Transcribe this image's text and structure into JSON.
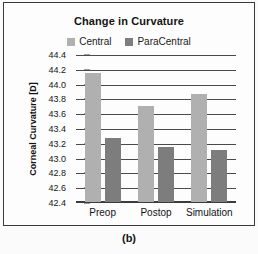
{
  "figure": {
    "caption": "(b)"
  },
  "chart_data": {
    "type": "bar",
    "title": "Change in Curvature",
    "xlabel": "",
    "ylabel": "Corneal Curvature [D]",
    "categories": [
      "Preop",
      "Postop",
      "Simulation"
    ],
    "series": [
      {
        "name": "Central",
        "color": "#b0b0b0",
        "values": [
          44.15,
          43.7,
          43.86
        ]
      },
      {
        "name": "ParaCentral",
        "color": "#7d7d7d",
        "values": [
          43.27,
          43.15,
          43.1
        ]
      }
    ],
    "ylim": [
      42.4,
      44.4
    ],
    "ytick_step": 0.2,
    "yticks": [
      "44.4",
      "44.2",
      "44.0",
      "43.8",
      "43.6",
      "43.4",
      "43.2",
      "43.0",
      "42.8",
      "42.6",
      "42.4"
    ],
    "grid": true,
    "legend_position": "top"
  }
}
